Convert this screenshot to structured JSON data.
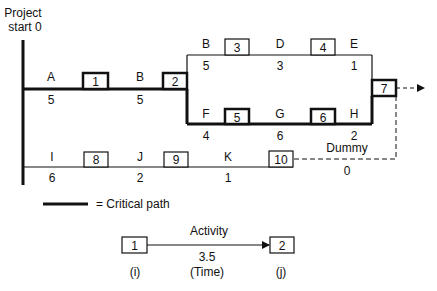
{
  "title": {
    "line1": "Project",
    "line2": "start 0"
  },
  "colors": {
    "ink": "#111111",
    "background": "#ffffff"
  },
  "nodes": [
    {
      "id": "1",
      "label": "1",
      "critical": true
    },
    {
      "id": "2",
      "label": "2",
      "critical": true
    },
    {
      "id": "3",
      "label": "3",
      "critical": false
    },
    {
      "id": "4",
      "label": "4",
      "critical": false
    },
    {
      "id": "5",
      "label": "5",
      "critical": true
    },
    {
      "id": "6",
      "label": "6",
      "critical": true
    },
    {
      "id": "7",
      "label": "7",
      "critical": true
    },
    {
      "id": "8",
      "label": "8",
      "critical": false
    },
    {
      "id": "9",
      "label": "9",
      "critical": false
    },
    {
      "id": "10",
      "label": "10",
      "critical": false
    }
  ],
  "activities": [
    {
      "name": "A",
      "time": "5",
      "from": "start",
      "to": "1",
      "critical": true
    },
    {
      "name": "B",
      "time": "5",
      "from": "1",
      "to": "2",
      "critical": true
    },
    {
      "name": "B",
      "time": "5",
      "from": "2",
      "to": "3",
      "critical": false
    },
    {
      "name": "D",
      "time": "3",
      "from": "3",
      "to": "4",
      "critical": false
    },
    {
      "name": "E",
      "time": "1",
      "from": "4",
      "to": "7",
      "critical": false
    },
    {
      "name": "F",
      "time": "4",
      "from": "2",
      "to": "5",
      "critical": true
    },
    {
      "name": "G",
      "time": "6",
      "from": "5",
      "to": "6",
      "critical": true
    },
    {
      "name": "H",
      "time": "2",
      "from": "6",
      "to": "7",
      "critical": true
    },
    {
      "name": "I",
      "time": "6",
      "from": "start",
      "to": "8",
      "critical": false
    },
    {
      "name": "J",
      "time": "2",
      "from": "8",
      "to": "9",
      "critical": false
    },
    {
      "name": "K",
      "time": "1",
      "from": "9",
      "to": "10",
      "critical": false
    },
    {
      "name": "Dummy",
      "time": "0",
      "from": "10",
      "to": "7",
      "critical": false,
      "dashed": true
    }
  ],
  "legend": {
    "critical_path_label": "= Critical path",
    "example": {
      "from_node": "1",
      "to_node": "2",
      "activity_label": "Activity",
      "time_value": "3.5",
      "time_label": "(Time)",
      "from_label": "(i)",
      "to_label": "(j)"
    }
  }
}
